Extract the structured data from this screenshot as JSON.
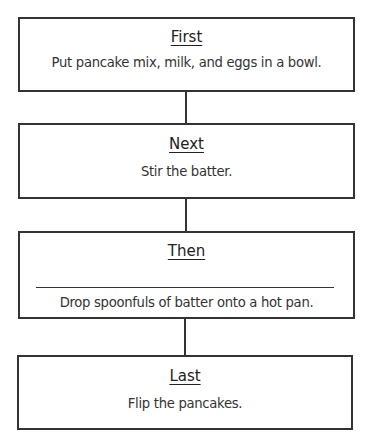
{
  "steps": [
    {
      "title": "First",
      "text": "Put pancake mix, milk, and eggs in a bowl.",
      "blank": false
    },
    {
      "title": "Next",
      "text": "Stir the batter.",
      "blank": false
    },
    {
      "title": "Then",
      "text": "Drop spoonfuls of batter onto a hot pan.",
      "blank": true
    },
    {
      "title": "Last",
      "text": "Flip the pancakes.",
      "blank": false
    }
  ],
  "colors": {
    "line": "#333333",
    "background": "#ffffff"
  }
}
